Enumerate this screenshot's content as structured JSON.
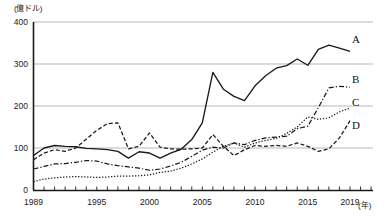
{
  "chart_data": {
    "type": "line",
    "title": "",
    "subtitle": "",
    "xlabel": "(年)",
    "ylabel": "(億ドル)",
    "unit_label": "(億ドル)",
    "x_unit_label": "(年)",
    "grid": true,
    "legend_position": "right-end-of-line",
    "xlim": [
      1989,
      2019
    ],
    "ylim": [
      0,
      400
    ],
    "yticks": [
      0,
      100,
      200,
      300,
      400
    ],
    "ytick_labels": [
      "0",
      "100",
      "200",
      "300",
      "400"
    ],
    "xticks": [
      1989,
      1995,
      2000,
      2005,
      2010,
      2015,
      2019
    ],
    "xtick_labels": [
      "1989",
      "1995",
      "2000",
      "2005",
      "2010",
      "2015",
      "2019"
    ],
    "x": [
      1989,
      1990,
      1991,
      1992,
      1993,
      1994,
      1995,
      1996,
      1997,
      1998,
      1999,
      2000,
      2001,
      2002,
      2003,
      2004,
      2005,
      2006,
      2007,
      2008,
      2009,
      2010,
      2011,
      2012,
      2013,
      2014,
      2015,
      2016,
      2017,
      2018,
      2019
    ],
    "series": [
      {
        "name": "A",
        "label": "A",
        "style": "solid",
        "color": "#1a1a1a",
        "values": [
          82,
          100,
          106,
          104,
          103,
          99,
          98,
          96,
          92,
          76,
          91,
          88,
          76,
          88,
          97,
          120,
          160,
          280,
          240,
          223,
          213,
          248,
          272,
          290,
          296,
          312,
          297,
          335,
          345,
          338,
          330
        ]
      },
      {
        "name": "B",
        "label": "B",
        "style": "dash-dot",
        "color": "#1a1a1a",
        "values": [
          50,
          56,
          62,
          63,
          66,
          70,
          69,
          62,
          58,
          55,
          52,
          47,
          50,
          57,
          66,
          80,
          95,
          102,
          100,
          112,
          108,
          118,
          124,
          126,
          128,
          146,
          152,
          196,
          243,
          247,
          245
        ]
      },
      {
        "name": "C",
        "label": "C",
        "style": "dotted-fine",
        "color": "#1a1a1a",
        "values": [
          20,
          26,
          29,
          31,
          32,
          31,
          30,
          31,
          33,
          33,
          34,
          36,
          42,
          45,
          52,
          62,
          74,
          90,
          104,
          112,
          102,
          112,
          118,
          123,
          135,
          150,
          174,
          168,
          172,
          186,
          195
        ]
      },
      {
        "name": "D",
        "label": "D",
        "style": "dashed",
        "color": "#1a1a1a",
        "values": [
          72,
          88,
          96,
          92,
          100,
          121,
          142,
          158,
          160,
          98,
          104,
          136,
          102,
          98,
          97,
          98,
          100,
          132,
          104,
          82,
          96,
          106,
          104,
          106,
          104,
          112,
          104,
          92,
          98,
          124,
          165
        ]
      }
    ]
  },
  "axis": {
    "unit_label": "(億ドル)",
    "x_unit": "(年)"
  },
  "series_labels": {
    "a": "A",
    "b": "B",
    "c": "C",
    "d": "D"
  }
}
